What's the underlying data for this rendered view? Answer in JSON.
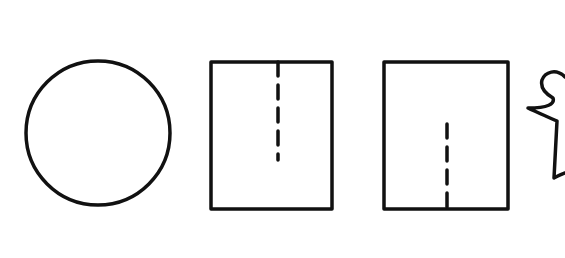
{
  "diagram": {
    "stroke_color": "#111111",
    "background": "#ffffff",
    "shapes": [
      {
        "id": "circle",
        "type": "circle",
        "cx": 98,
        "cy": 133,
        "r": 72
      },
      {
        "id": "rect-top-cut",
        "type": "rect",
        "x": 211,
        "y": 62,
        "w": 121,
        "h": 147,
        "dashed_line": {
          "x": 278,
          "y1": 62,
          "y2": 160
        }
      },
      {
        "id": "rect-bottom-cut",
        "type": "rect",
        "x": 384,
        "y": 62,
        "w": 124,
        "h": 147,
        "dashed_line": {
          "x": 447,
          "y1": 123,
          "y2": 209
        }
      },
      {
        "id": "freeform-figure",
        "type": "path",
        "partial": true
      }
    ]
  }
}
